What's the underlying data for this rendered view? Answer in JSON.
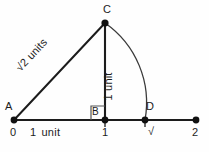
{
  "figure": {
    "kind": "geometry-construction-diagram",
    "background_color": "#fefefe",
    "stroke_color": "#1c1c1c",
    "points": {
      "A": {
        "label": "A",
        "x": 14,
        "y": 120,
        "value": "0"
      },
      "B": {
        "label": "B",
        "x": 105,
        "y": 120,
        "value": "1"
      },
      "C": {
        "label": "C",
        "x": 105,
        "y": 23
      },
      "D": {
        "label": "D",
        "x": 145,
        "y": 120,
        "value": "√2"
      },
      "E": {
        "x": 196,
        "y": 120,
        "value": "2"
      }
    },
    "axis": {
      "start_x": 14,
      "end_x": 196,
      "y": 120,
      "ticks": [
        {
          "name": "tick-0",
          "label": "0",
          "x": 14
        },
        {
          "name": "tick-1",
          "label": "1",
          "x": 105
        },
        {
          "name": "tick-r2",
          "radical": "2",
          "x": 145
        },
        {
          "name": "tick-2",
          "label": "2",
          "x": 196
        }
      ]
    },
    "measurements": {
      "base": {
        "number": "1",
        "unit": "unit"
      },
      "vertical": {
        "number": "1",
        "unit": "unit"
      },
      "hypotenuse": {
        "radicand": "2",
        "unit": "units"
      }
    },
    "right_angle_marker": {
      "at": "B",
      "size": 14
    },
    "arc": {
      "from": "C",
      "to": "D",
      "center": "B",
      "radius": 97
    }
  }
}
